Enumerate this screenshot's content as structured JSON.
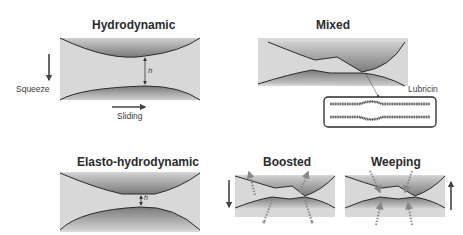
{
  "panels": {
    "hydrodynamic": {
      "title": "Hydrodynamic",
      "gap_label": "h",
      "squeeze_label": "Squeeze",
      "sliding_label": "Sliding"
    },
    "mixed": {
      "title": "Mixed",
      "inset_label": "Lubricin"
    },
    "elastohydrodynamic": {
      "title": "Elasto-hydrodynamic",
      "gap_label": "h"
    },
    "boosted": {
      "title": "Boosted"
    },
    "weeping": {
      "title": "Weeping"
    }
  },
  "colors": {
    "fluid": "#d6d6d6",
    "surface_dark": "#6e6e6e",
    "outline": "#2a2a2a",
    "arrow": "#444444",
    "flow_dots": "#8a8a8a"
  }
}
